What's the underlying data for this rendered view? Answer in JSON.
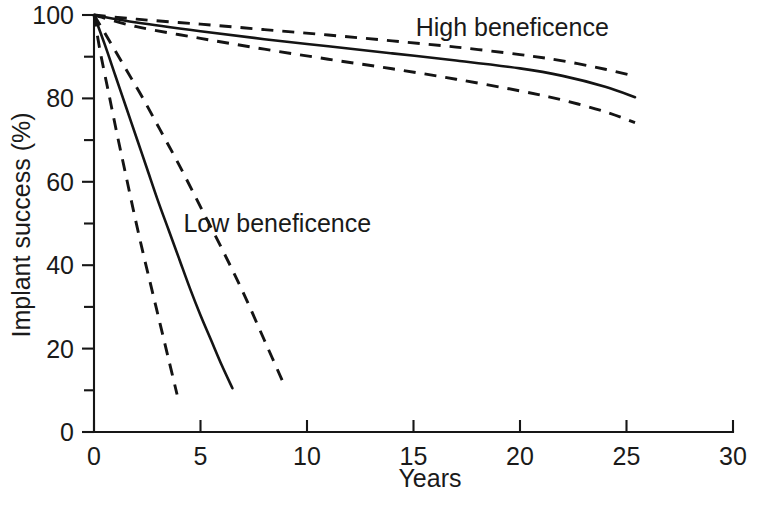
{
  "chart_data": {
    "type": "line",
    "title": "",
    "xlabel": "Years",
    "ylabel": "Implant success (%)",
    "xlim": [
      0,
      30
    ],
    "ylim": [
      0,
      100
    ],
    "grid": false,
    "legend_position": "inline-annotations",
    "x_ticks_major": [
      0,
      5,
      10,
      15,
      20,
      25,
      30
    ],
    "x_tick_labels": [
      "0",
      "5",
      "10",
      "15",
      "20",
      "25",
      "30"
    ],
    "y_ticks_major": [
      0,
      20,
      40,
      60,
      80,
      100
    ],
    "y_tick_labels": [
      "0",
      "20",
      "40",
      "60",
      "80",
      "100"
    ],
    "y_ticks_minor": [
      10,
      30,
      50,
      70,
      90
    ],
    "annotations": [
      {
        "text": "High beneficence",
        "x": 15.1,
        "y": 95.0
      },
      {
        "text": "Low beneficence",
        "x": 4.2,
        "y": 48.0
      }
    ],
    "series": [
      {
        "name": "High beneficence",
        "style": "solid",
        "role": "estimate",
        "x": [
          0,
          2,
          5,
          8,
          11,
          14,
          17,
          20,
          22,
          24,
          25.4
        ],
        "y": [
          100,
          98.2,
          96.1,
          94.2,
          92.5,
          90.8,
          89.1,
          87.2,
          85.4,
          82.8,
          80.3
        ]
      },
      {
        "name": "High beneficence upper CI",
        "style": "dashed",
        "role": "upper-confidence-limit",
        "x": [
          0,
          2,
          5,
          8,
          11,
          14,
          17,
          20,
          22,
          24,
          25.4
        ],
        "y": [
          100,
          99.0,
          97.8,
          96.5,
          95.2,
          93.8,
          92.3,
          90.5,
          89.0,
          87.0,
          85.3
        ]
      },
      {
        "name": "High beneficence lower CI",
        "style": "dashed",
        "role": "lower-confidence-limit",
        "x": [
          0,
          2,
          5,
          8,
          11,
          14,
          17,
          20,
          22,
          24,
          25.4
        ],
        "y": [
          100,
          97.2,
          94.4,
          91.8,
          89.4,
          87.1,
          84.6,
          81.8,
          79.6,
          76.8,
          74.2
        ]
      },
      {
        "name": "Low beneficence",
        "style": "solid",
        "role": "estimate",
        "x": [
          0,
          0.5,
          1,
          1.5,
          2,
          2.5,
          3,
          3.5,
          4,
          4.5,
          5,
          5.5,
          6,
          6.5
        ],
        "y": [
          100,
          93.0,
          85.5,
          78.0,
          70.5,
          63.0,
          55.5,
          48.5,
          41.5,
          34.5,
          28.0,
          22.0,
          16.0,
          10.5
        ]
      },
      {
        "name": "Low beneficence upper CI",
        "style": "dashed",
        "role": "upper-confidence-limit",
        "x": [
          0,
          0.7,
          1.5,
          2.3,
          3.1,
          4,
          5,
          6,
          7,
          8,
          9
        ],
        "y": [
          100,
          94.0,
          87.0,
          80.0,
          72.5,
          64.0,
          54.0,
          44.0,
          33.5,
          22.0,
          10.5
        ]
      },
      {
        "name": "Low beneficence lower CI",
        "style": "dashed",
        "role": "lower-confidence-limit",
        "x": [
          0,
          0.3,
          0.7,
          1.1,
          1.5,
          1.9,
          2.3,
          2.7,
          3.1,
          3.5,
          3.9
        ],
        "y": [
          100,
          91.0,
          81.0,
          71.0,
          61.5,
          52.0,
          43.0,
          34.5,
          26.0,
          17.5,
          9.0
        ]
      }
    ]
  },
  "figure": {
    "background_color": "#ffffff",
    "ink_color": "#141414"
  }
}
